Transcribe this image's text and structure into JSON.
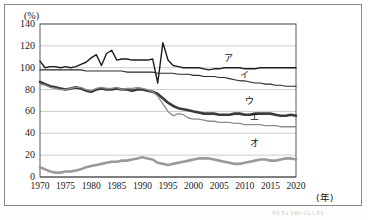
{
  "figure": {
    "title": "",
    "y_unit_label": "(%)",
    "x_unit_label": "(年)",
    "caption_artifact": "のうぎょうせいさんしすう"
  },
  "chart_data": {
    "type": "line",
    "title": "",
    "xlabel": "(年)",
    "ylabel": "(%)",
    "xlim": [
      1970,
      2020
    ],
    "ylim": [
      0,
      140
    ],
    "ytick_labels": [
      "0",
      "20",
      "40",
      "60",
      "80",
      "100",
      "120",
      "140"
    ],
    "yticks": [
      0,
      20,
      40,
      60,
      80,
      100,
      120,
      140
    ],
    "xtick_labels": [
      "1970",
      "1975",
      "1980",
      "1985",
      "1990",
      "1995",
      "2000",
      "2005",
      "2010",
      "2015",
      "2020"
    ],
    "xticks": [
      1970,
      1975,
      1980,
      1985,
      1990,
      1995,
      2000,
      2005,
      2010,
      2015,
      2020
    ],
    "grid": true,
    "grid_axis": "y",
    "legend_position": "inline-right",
    "x": [
      1970,
      1971,
      1972,
      1973,
      1974,
      1975,
      1976,
      1977,
      1978,
      1979,
      1980,
      1981,
      1982,
      1983,
      1984,
      1985,
      1986,
      1987,
      1988,
      1989,
      1990,
      1991,
      1992,
      1993,
      1994,
      1995,
      1996,
      1997,
      1998,
      1999,
      2000,
      2001,
      2002,
      2003,
      2004,
      2005,
      2006,
      2007,
      2008,
      2009,
      2010,
      2011,
      2012,
      2013,
      2014,
      2015,
      2016,
      2017,
      2018,
      2019,
      2020
    ],
    "series": [
      {
        "name": "ア",
        "label": "ア",
        "color": "#1c1c1c",
        "width": 1.4,
        "values": [
          106,
          100,
          101,
          101,
          100,
          101,
          100,
          101,
          103,
          105,
          109,
          112,
          102,
          113,
          116,
          107,
          108,
          108,
          107,
          107,
          107,
          107,
          108,
          86,
          123,
          107,
          102,
          101,
          100,
          100,
          100,
          100,
          99,
          98,
          99,
          99,
          100,
          100,
          100,
          100,
          99,
          99,
          99,
          100,
          100,
          100,
          100,
          100,
          100,
          100,
          100
        ]
      },
      {
        "name": "イ",
        "label": "イ",
        "color": "#2b2b2b",
        "width": 1.1,
        "values": [
          98,
          98,
          98,
          98,
          98,
          98,
          98,
          98,
          98,
          97,
          97,
          97,
          97,
          97,
          97,
          97,
          97,
          96,
          96,
          96,
          96,
          96,
          96,
          95,
          95,
          95,
          95,
          94,
          94,
          94,
          93,
          93,
          92,
          92,
          92,
          91,
          91,
          90,
          89,
          88,
          88,
          87,
          86,
          86,
          85,
          85,
          84,
          84,
          83,
          83,
          83
        ]
      },
      {
        "name": "ウ",
        "label": "ウ",
        "color": "#3b3b3b",
        "width": 2.6,
        "values": [
          87,
          85,
          83,
          82,
          81,
          80,
          81,
          82,
          81,
          79,
          78,
          80,
          81,
          80,
          80,
          81,
          80,
          80,
          79,
          80,
          80,
          79,
          78,
          76,
          72,
          68,
          65,
          63,
          62,
          61,
          60,
          59,
          58,
          58,
          58,
          57,
          57,
          57,
          58,
          58,
          57,
          57,
          58,
          58,
          58,
          58,
          57,
          56,
          56,
          57,
          56
        ]
      },
      {
        "name": "エ",
        "label": "エ",
        "color": "#8d8d8d",
        "width": 1.3,
        "values": [
          85,
          84,
          82,
          81,
          80,
          80,
          81,
          82,
          82,
          80,
          79,
          81,
          82,
          81,
          81,
          82,
          80,
          81,
          81,
          82,
          81,
          80,
          78,
          74,
          67,
          60,
          56,
          58,
          57,
          54,
          53,
          53,
          52,
          51,
          51,
          50,
          50,
          50,
          49,
          49,
          48,
          48,
          48,
          48,
          47,
          47,
          47,
          46,
          46,
          46,
          46
        ]
      },
      {
        "name": "オ",
        "label": "オ",
        "color": "#9a9a9a",
        "width": 2.6,
        "values": [
          9,
          7,
          5,
          4,
          4,
          5,
          5,
          6,
          7,
          9,
          10,
          11,
          12,
          13,
          14,
          14,
          15,
          15,
          16,
          17,
          18,
          17,
          16,
          13,
          12,
          11,
          12,
          13,
          14,
          15,
          16,
          17,
          17,
          17,
          16,
          15,
          14,
          13,
          12,
          12,
          13,
          14,
          15,
          16,
          16,
          15,
          15,
          16,
          17,
          17,
          16
        ]
      }
    ],
    "series_label_positions": [
      {
        "name": "ア",
        "x": 2006,
        "y": 108
      },
      {
        "name": "イ",
        "x": 2009,
        "y": 92
      },
      {
        "name": "ウ",
        "x": 2010,
        "y": 69
      },
      {
        "name": "エ",
        "x": 2011,
        "y": 54
      },
      {
        "name": "オ",
        "x": 2011,
        "y": 30
      }
    ]
  }
}
